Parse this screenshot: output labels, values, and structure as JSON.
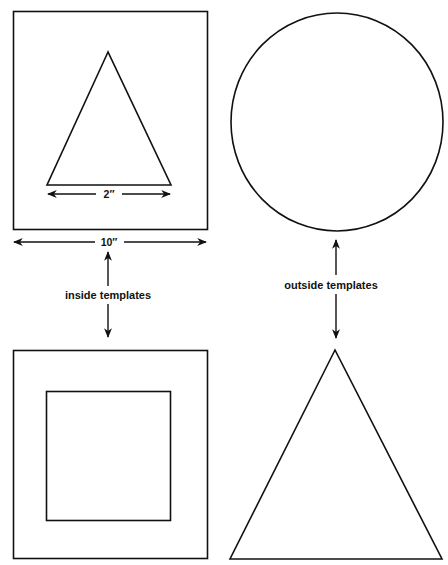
{
  "diagram": {
    "type": "template-illustration",
    "groups": [
      {
        "id": "inside",
        "label": "inside templates",
        "items": [
          {
            "shape": "square-with-triangle",
            "description": "Square with a triangle drawn inside"
          },
          {
            "shape": "square-with-square",
            "description": "Square with a smaller square inside"
          }
        ]
      },
      {
        "id": "outside",
        "label": "outside templates",
        "items": [
          {
            "shape": "circle",
            "description": "Circle"
          },
          {
            "shape": "triangle",
            "description": "Triangle"
          }
        ]
      }
    ],
    "dimensions": {
      "inner_triangle_base": "2″",
      "square_width": "10″"
    },
    "labels": {
      "inside": "inside templates",
      "outside": "outside templates"
    },
    "colors": {
      "stroke": "#111111",
      "background": "#ffffff"
    }
  }
}
